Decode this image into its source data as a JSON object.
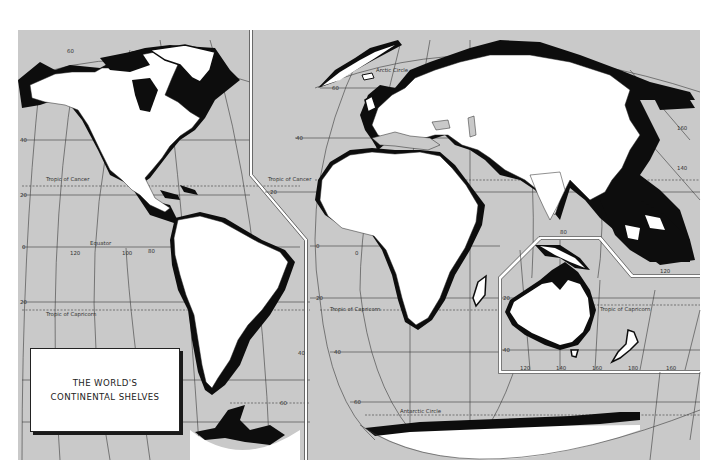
{
  "title": {
    "line1": "THE WORLD'S",
    "line2": "CONTINENTAL SHELVES"
  },
  "colors": {
    "ocean": "#c9c9c9",
    "land": "#ffffff",
    "shelf": "#0d0d0d",
    "grid": "#3a3a3a",
    "paper": "#ffffff"
  },
  "labels": {
    "arctic_circle": "Arctic Circle",
    "antarctic_circle": "Antarctic Circle",
    "tropic_of_cancer_west": "Tropic of Cancer",
    "tropic_of_cancer_east": "Tropic of Cancer",
    "tropic_of_capricorn_west": "Tropic of Capricorn",
    "tropic_of_capricorn_africa": "Tropic of Capricorn",
    "tropic_of_capricorn_australia": "Tropic of Capricorn",
    "equator": "Equator"
  },
  "latitude_ticks": {
    "west": [
      "60",
      "40",
      "20",
      "0",
      "20"
    ],
    "americas_east": [
      "40",
      "60"
    ],
    "eurafrica": [
      "60",
      "40",
      "20",
      "0",
      "20",
      "40",
      "60"
    ],
    "australia_inset": [
      "20",
      "40"
    ]
  },
  "longitude_ticks": {
    "pacific": [
      "120",
      "100",
      "80"
    ],
    "asia": [
      "160",
      "140",
      "120",
      "80"
    ],
    "australia_inset": [
      "120",
      "140",
      "160",
      "180",
      "160"
    ],
    "africa": [
      "0"
    ]
  },
  "panels": [
    {
      "name": "Americas",
      "region": "west"
    },
    {
      "name": "Europe-Africa-Asia",
      "region": "east"
    },
    {
      "name": "Australia-Oceania",
      "region": "inset"
    }
  ]
}
